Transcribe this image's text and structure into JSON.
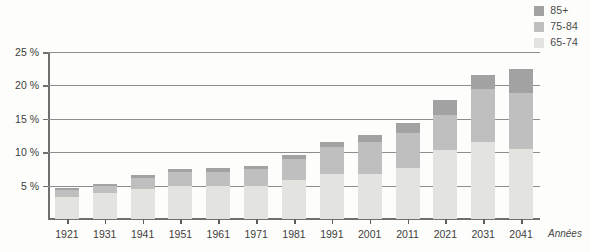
{
  "chart_data": {
    "type": "bar",
    "stacked": true,
    "title": "",
    "xlabel": "Années",
    "ylabel": "",
    "categories": [
      "1921",
      "1931",
      "1941",
      "1951",
      "1961",
      "1971",
      "1981",
      "1991",
      "2001",
      "2011",
      "2021",
      "2031",
      "2041"
    ],
    "series": [
      {
        "name": "65-74",
        "color": "#e3e3e0",
        "values": [
          3.3,
          3.9,
          4.5,
          5.0,
          4.9,
          5.0,
          5.9,
          6.7,
          6.7,
          7.6,
          10.4,
          11.6,
          10.5
        ]
      },
      {
        "name": "75-84",
        "color": "#bfbfbf",
        "values": [
          1.0,
          1.1,
          1.6,
          2.1,
          2.2,
          2.5,
          3.1,
          4.1,
          4.9,
          5.3,
          5.2,
          7.9,
          8.3
        ]
      },
      {
        "name": "85+",
        "color": "#a2a2a2",
        "values": [
          0.3,
          0.3,
          0.5,
          0.4,
          0.5,
          0.5,
          0.6,
          0.7,
          1.0,
          1.5,
          2.2,
          2.0,
          3.7
        ]
      }
    ],
    "totals": [
      4.6,
      5.3,
      6.6,
      7.5,
      7.6,
      8.0,
      9.6,
      11.5,
      12.6,
      14.4,
      17.8,
      21.5,
      22.5
    ],
    "ylim": [
      0,
      25
    ],
    "yticks": [
      5,
      10,
      15,
      20,
      25
    ],
    "ytick_labels": [
      "5 %",
      "10 %",
      "15 %",
      "20 %",
      "25 %"
    ],
    "grid": true,
    "legend_position": "top-right",
    "legend_entries": [
      "85+",
      "75-84",
      "65-74"
    ]
  },
  "legend": {
    "items": [
      {
        "label": "85+",
        "color": "#a2a2a2"
      },
      {
        "label": "75-84",
        "color": "#bfbfbf"
      },
      {
        "label": "65-74",
        "color": "#e3e3e0"
      }
    ]
  },
  "axes": {
    "x_axis_name": "Années"
  },
  "colors": {
    "background": "#fdfdfb",
    "axis": "#6f6f6f",
    "grid": "#8d8d8d",
    "text": "#3e3e3e"
  }
}
